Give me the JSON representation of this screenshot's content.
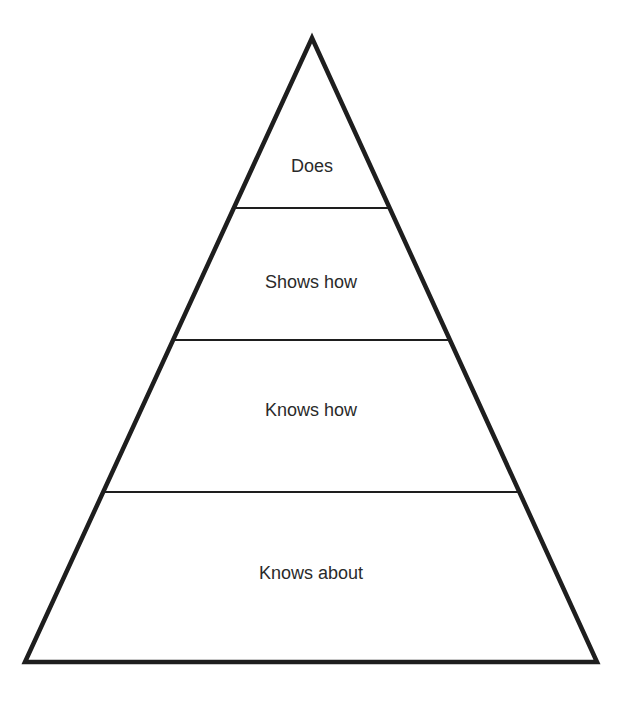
{
  "diagram": {
    "type": "pyramid",
    "levels": [
      {
        "label": "Does"
      },
      {
        "label": "Shows how"
      },
      {
        "label": "Knows how"
      },
      {
        "label": "Knows about"
      }
    ],
    "colors": {
      "stroke": "#1e1e1e",
      "fill": "#ffffff",
      "text": "#2a2a2a"
    }
  }
}
